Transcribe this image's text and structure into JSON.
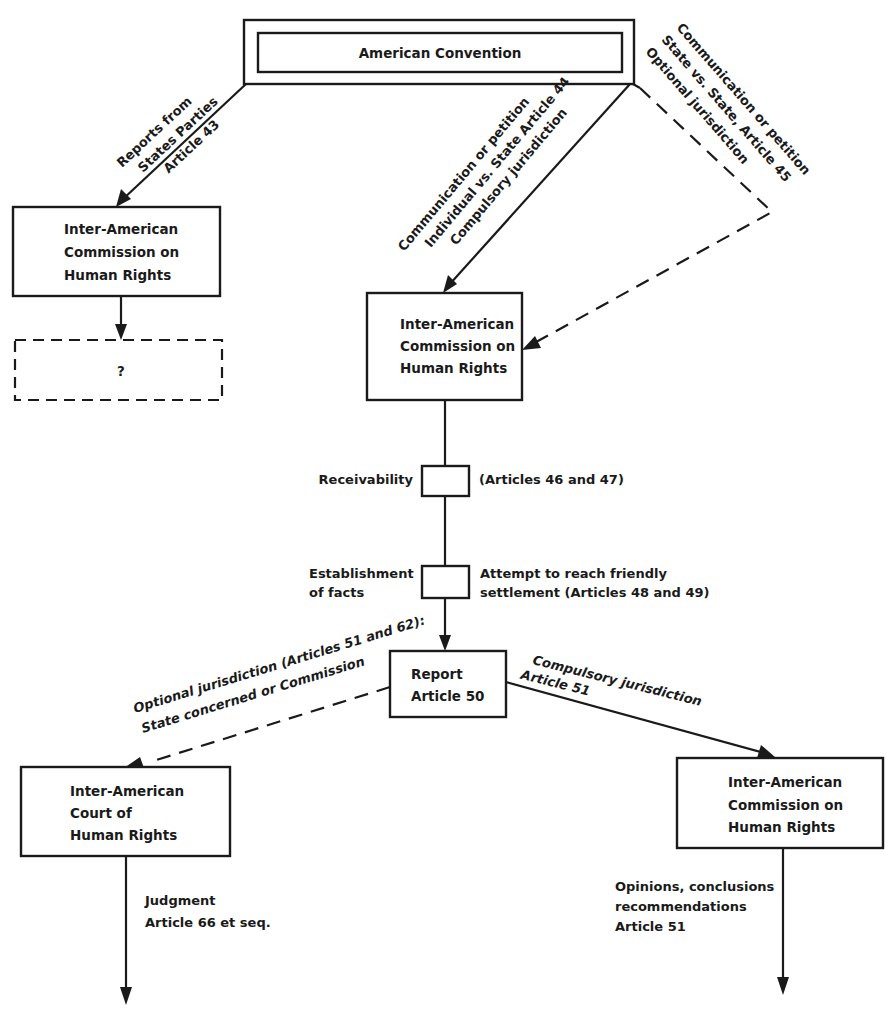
{
  "diagram": {
    "title_node": {
      "label": "American Convention"
    },
    "nodes": {
      "commission_reports": {
        "lines": [
          "Inter-American",
          "Commission on",
          "Human Rights"
        ]
      },
      "unknown_outcome": {
        "label": "?"
      },
      "commission_petitions": {
        "lines": [
          "Inter-American",
          "Commission on",
          "Human Rights"
        ]
      },
      "receivability_step": {
        "left_label": "Receivability",
        "right_label": "(Articles 46 and 47)"
      },
      "facts_step": {
        "left_lines": [
          "Establishment",
          "of facts"
        ],
        "right_lines": [
          "Attempt to reach friendly",
          "settlement (Articles 48 and 49)"
        ]
      },
      "report": {
        "lines": [
          "Report",
          "Article 50"
        ]
      },
      "court": {
        "lines": [
          "Inter-American",
          "Court of",
          "Human Rights"
        ]
      },
      "commission_final": {
        "lines": [
          "Inter-American",
          "Commission on",
          "Human Rights"
        ]
      }
    },
    "edges": {
      "reports_from_states": {
        "lines": [
          "Reports from",
          "States Parties",
          "Article 43"
        ]
      },
      "individual_petition": {
        "lines": [
          "Communication or petition",
          "Individual vs. State Article 44",
          "Compulsory jurisdiction"
        ]
      },
      "state_petition": {
        "lines": [
          "Communication or petition",
          "State vs. State, Article 45",
          "Optional jurisdiction"
        ]
      },
      "optional_to_court": {
        "lines": [
          "Optional jurisdiction (Articles 51 and 62):",
          "State concerned or Commission"
        ]
      },
      "compulsory_to_commission": {
        "lines": [
          "Compulsory jurisdiction",
          "Article 51"
        ]
      },
      "judgment": {
        "lines": [
          "Judgment",
          "Article 66 et seq."
        ]
      },
      "opinions": {
        "lines": [
          "Opinions, conclusions",
          "recommendations",
          "Article 51"
        ]
      }
    }
  }
}
